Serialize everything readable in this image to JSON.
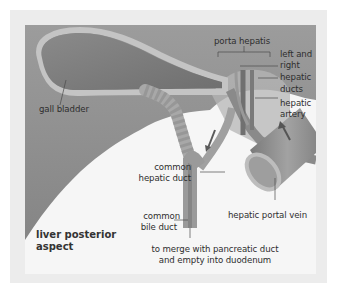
{
  "diagram": {
    "title_line1": "liver posterior",
    "title_line2": "aspect",
    "labels": {
      "gall_bladder": "gall bladder",
      "porta_hepatis": "porta hepatis",
      "left_right_1": "left and",
      "left_right_2": "right",
      "left_right_3": "hepatic",
      "left_right_4": "ducts",
      "hepatic_artery_1": "hepatic",
      "hepatic_artery_2": "artery",
      "common_hepatic_1": "common",
      "common_hepatic_2": "hepatic duct",
      "common_bile_1": "common",
      "common_bile_2": "bile duct",
      "portal_vein": "hepatic portal vein",
      "merge_1": "to merge with pancreatic duct",
      "merge_2": "and empty into duodenum"
    },
    "colors": {
      "liver": "#8e8e8e",
      "gall_bladder": "#7d7d7d",
      "duct": "#9a9a9a",
      "vein": "#8a8a8a",
      "background": "#f6f6f6",
      "frame": "#ececec"
    }
  }
}
